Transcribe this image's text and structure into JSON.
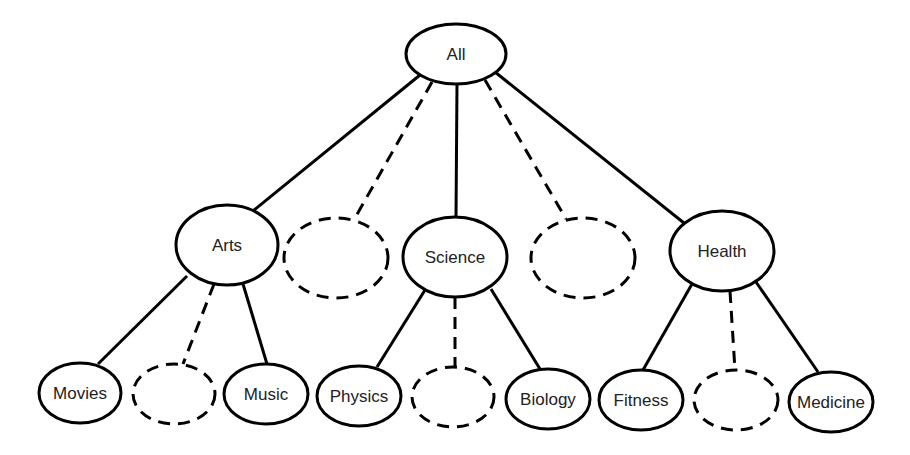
{
  "diagram": {
    "type": "tree",
    "root": {
      "id": "all",
      "label": "All"
    },
    "nodes": [
      {
        "id": "all",
        "label": "All",
        "cx": 456,
        "cy": 54,
        "rx": 50,
        "ry": 30,
        "dashed": false
      },
      {
        "id": "arts",
        "label": "Arts",
        "cx": 227,
        "cy": 245,
        "rx": 51,
        "ry": 40,
        "dashed": false
      },
      {
        "id": "placeholder-1",
        "label": "",
        "cx": 336,
        "cy": 258,
        "rx": 52,
        "ry": 40,
        "dashed": true
      },
      {
        "id": "science",
        "label": "Science",
        "cx": 455,
        "cy": 257,
        "rx": 52,
        "ry": 40,
        "dashed": false
      },
      {
        "id": "placeholder-2",
        "label": "",
        "cx": 583,
        "cy": 258,
        "rx": 52,
        "ry": 40,
        "dashed": true
      },
      {
        "id": "health",
        "label": "Health",
        "cx": 722,
        "cy": 251,
        "rx": 52,
        "ry": 40,
        "dashed": false
      },
      {
        "id": "movies",
        "label": "Movies",
        "cx": 80,
        "cy": 393,
        "rx": 41,
        "ry": 30,
        "dashed": false
      },
      {
        "id": "placeholder-3",
        "label": "",
        "cx": 174,
        "cy": 394,
        "rx": 41,
        "ry": 30,
        "dashed": true
      },
      {
        "id": "music",
        "label": "Music",
        "cx": 266,
        "cy": 394,
        "rx": 42,
        "ry": 30,
        "dashed": false
      },
      {
        "id": "physics",
        "label": "Physics",
        "cx": 359,
        "cy": 396,
        "rx": 42,
        "ry": 30,
        "dashed": false
      },
      {
        "id": "placeholder-4",
        "label": "",
        "cx": 453,
        "cy": 397,
        "rx": 41,
        "ry": 30,
        "dashed": true
      },
      {
        "id": "biology",
        "label": "Biology",
        "cx": 548,
        "cy": 399,
        "rx": 42,
        "ry": 30,
        "dashed": false
      },
      {
        "id": "fitness",
        "label": "Fitness",
        "cx": 641,
        "cy": 400,
        "rx": 42,
        "ry": 30,
        "dashed": false
      },
      {
        "id": "placeholder-5",
        "label": "",
        "cx": 736,
        "cy": 400,
        "rx": 42,
        "ry": 30,
        "dashed": true
      },
      {
        "id": "medicine",
        "label": "Medicine",
        "cx": 831,
        "cy": 402,
        "rx": 42,
        "ry": 30,
        "dashed": false
      }
    ],
    "edges": [
      {
        "from": "all",
        "to": "arts",
        "x1": 420,
        "y1": 75,
        "x2": 253,
        "y2": 211,
        "dashed": false
      },
      {
        "from": "all",
        "to": "placeholder-1",
        "x1": 432,
        "y1": 82,
        "x2": 355,
        "y2": 218,
        "dashed": true
      },
      {
        "from": "all",
        "to": "science",
        "x1": 457,
        "y1": 84,
        "x2": 456,
        "y2": 217,
        "dashed": false
      },
      {
        "from": "all",
        "to": "placeholder-2",
        "x1": 485,
        "y1": 80,
        "x2": 566,
        "y2": 219,
        "dashed": true
      },
      {
        "from": "all",
        "to": "health",
        "x1": 495,
        "y1": 72,
        "x2": 684,
        "y2": 223,
        "dashed": false
      },
      {
        "from": "arts",
        "to": "movies",
        "x1": 187,
        "y1": 276,
        "x2": 98,
        "y2": 364,
        "dashed": false
      },
      {
        "from": "arts",
        "to": "placeholder-3",
        "x1": 214,
        "y1": 284,
        "x2": 183,
        "y2": 364,
        "dashed": true
      },
      {
        "from": "arts",
        "to": "music",
        "x1": 243,
        "y1": 284,
        "x2": 267,
        "y2": 364,
        "dashed": false
      },
      {
        "from": "science",
        "to": "physics",
        "x1": 425,
        "y1": 290,
        "x2": 377,
        "y2": 367,
        "dashed": false
      },
      {
        "from": "science",
        "to": "placeholder-4",
        "x1": 455,
        "y1": 297,
        "x2": 455,
        "y2": 367,
        "dashed": true
      },
      {
        "from": "science",
        "to": "biology",
        "x1": 491,
        "y1": 289,
        "x2": 540,
        "y2": 369,
        "dashed": false
      },
      {
        "from": "health",
        "to": "fitness",
        "x1": 692,
        "y1": 284,
        "x2": 643,
        "y2": 370,
        "dashed": false
      },
      {
        "from": "health",
        "to": "placeholder-5",
        "x1": 730,
        "y1": 291,
        "x2": 735,
        "y2": 370,
        "dashed": true
      },
      {
        "from": "health",
        "to": "medicine",
        "x1": 756,
        "y1": 282,
        "x2": 818,
        "y2": 372,
        "dashed": false
      }
    ],
    "colors": {
      "stroke": "#000000",
      "fill": "#ffffff",
      "text": "#222222"
    }
  }
}
